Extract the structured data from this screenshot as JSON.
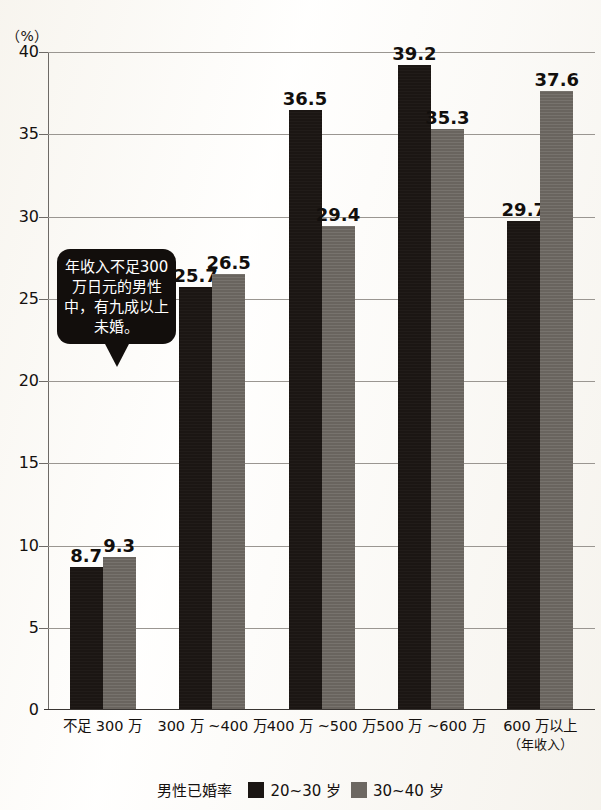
{
  "axis": {
    "unit_label": "（%）",
    "y_ticks": [
      "40",
      "35",
      "30",
      "25",
      "20",
      "15",
      "10",
      "5",
      "0"
    ]
  },
  "callout": {
    "text": "年收入不足300万日元的男性中，有九成以上未婚。"
  },
  "legend": {
    "title": "男性已婚率",
    "items": [
      {
        "label": "20~30 岁",
        "color": "#1b1613",
        "swatch": "dark"
      },
      {
        "label": "30~40 岁",
        "color": "#6d6862",
        "swatch": "gray"
      }
    ]
  },
  "x_labels": [
    {
      "main": "不足 300 万",
      "sub": ""
    },
    {
      "main": "300 万 ~400 万",
      "sub": ""
    },
    {
      "main": "400 万 ~500 万",
      "sub": ""
    },
    {
      "main": "500 万 ~600 万",
      "sub": ""
    },
    {
      "main": "600 万以上",
      "sub": "（年收入）"
    }
  ],
  "chart_data": {
    "type": "bar",
    "title": "",
    "xlabel": "年收入",
    "ylabel": "（%）",
    "ylim": [
      0,
      40
    ],
    "ytick_step": 5,
    "grid": true,
    "legend_position": "bottom",
    "categories": [
      "不足 300 万",
      "300 万 ~400 万",
      "400 万 ~500 万",
      "500 万 ~600 万",
      "600 万以上"
    ],
    "series": [
      {
        "name": "20~30 岁",
        "color": "#1b1613",
        "values": [
          8.7,
          25.7,
          36.5,
          39.2,
          29.7
        ]
      },
      {
        "name": "30~40 岁",
        "color": "#6d6862",
        "values": [
          9.3,
          26.5,
          29.4,
          35.3,
          37.6
        ]
      }
    ]
  }
}
